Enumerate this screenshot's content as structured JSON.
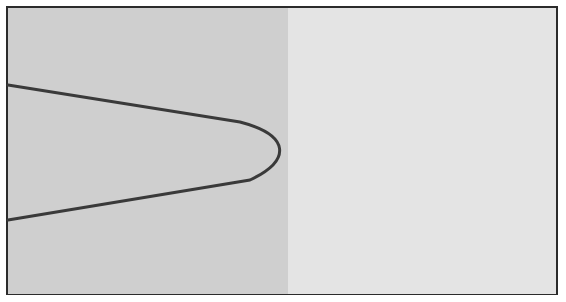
{
  "diagram": {
    "type": "region-boundary",
    "regions": [
      {
        "name": "shaded-region",
        "color": "#cfcfcf",
        "x_range": [
          8,
          288
        ]
      },
      {
        "name": "unshaded-region",
        "color": "#e4e4e4",
        "x_range": [
          288,
          558
        ]
      }
    ],
    "curve": {
      "color": "#3a3a3a",
      "stroke_width": 3,
      "points": [
        [
          8,
          85
        ],
        [
          250,
          123
        ],
        [
          287,
          150
        ],
        [
          250,
          182
        ],
        [
          8,
          220
        ]
      ]
    },
    "frame": {
      "border_color": "#2b2b2b",
      "background": "#e2e2e2"
    }
  }
}
